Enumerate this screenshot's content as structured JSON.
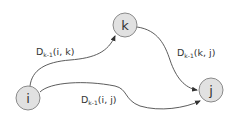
{
  "diagram": {
    "title": "",
    "colors": {
      "node_fill": "#e1e1e1",
      "node_stroke": "#8a8a8a",
      "edge": "#4a4a4a",
      "text": "#333333"
    },
    "nodes": [
      {
        "id": "i",
        "label": "i",
        "cx": 28,
        "cy": 98,
        "r": 12
      },
      {
        "id": "k",
        "label": "k",
        "cx": 125,
        "cy": 25,
        "r": 12
      },
      {
        "id": "j",
        "label": "j",
        "cx": 210,
        "cy": 90,
        "r": 12
      }
    ],
    "edges": [
      {
        "from": "i",
        "to": "k",
        "label_main": "D",
        "label_sub": "k-1",
        "label_args": "(i, k)"
      },
      {
        "from": "k",
        "to": "j",
        "label_main": "D",
        "label_sub": "k-1",
        "label_args": "(k, j)"
      },
      {
        "from": "i",
        "to": "j",
        "label_main": "D",
        "label_sub": "k-1",
        "label_args": "(i, j)"
      }
    ]
  }
}
